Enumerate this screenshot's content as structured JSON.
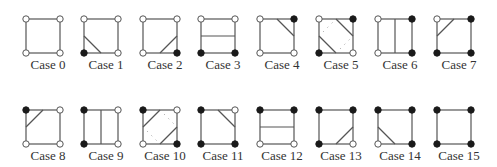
{
  "diagram": {
    "title": "",
    "colors": {
      "edge": "#555555",
      "contour": "#555555",
      "filled_vertex": "#1a1a1a",
      "empty_vertex_fill": "#ffffff",
      "empty_vertex_stroke": "#555555",
      "ambiguous_dots": "#999999",
      "label": "#333333"
    },
    "layout": {
      "square_size": 34,
      "column_x": [
        26,
        84,
        143,
        201,
        260,
        319,
        378,
        437
      ],
      "row_y": [
        19,
        110
      ],
      "label_offset_y": 38
    },
    "vertex_order": [
      "top-left",
      "top-right",
      "bottom-right",
      "bottom-left"
    ],
    "cases": [
      {
        "label": "Case 0",
        "row": 0,
        "col": 0,
        "vertices": [
          0,
          0,
          0,
          0
        ],
        "contours": [],
        "dotted": []
      },
      {
        "label": "Case 1",
        "row": 0,
        "col": 1,
        "vertices": [
          0,
          0,
          0,
          1
        ],
        "contours": [
          [
            "L",
            "B"
          ]
        ],
        "dotted": []
      },
      {
        "label": "Case 2",
        "row": 0,
        "col": 2,
        "vertices": [
          0,
          0,
          1,
          0
        ],
        "contours": [
          [
            "B",
            "R"
          ]
        ],
        "dotted": []
      },
      {
        "label": "Case 3",
        "row": 0,
        "col": 3,
        "vertices": [
          0,
          0,
          1,
          1
        ],
        "contours": [
          [
            "L",
            "R"
          ]
        ],
        "dotted": []
      },
      {
        "label": "Case 4",
        "row": 0,
        "col": 4,
        "vertices": [
          0,
          1,
          0,
          0
        ],
        "contours": [
          [
            "T",
            "R"
          ]
        ],
        "dotted": []
      },
      {
        "label": "Case 5",
        "row": 0,
        "col": 5,
        "vertices": [
          0,
          1,
          0,
          1
        ],
        "contours": [
          [
            "T",
            "R"
          ],
          [
            "L",
            "B"
          ]
        ],
        "dotted": [
          [
            "L",
            "T"
          ],
          [
            "B",
            "R"
          ]
        ]
      },
      {
        "label": "Case 6",
        "row": 0,
        "col": 6,
        "vertices": [
          0,
          1,
          1,
          0
        ],
        "contours": [
          [
            "T",
            "B"
          ]
        ],
        "dotted": []
      },
      {
        "label": "Case 7",
        "row": 0,
        "col": 7,
        "vertices": [
          0,
          1,
          1,
          1
        ],
        "contours": [
          [
            "T",
            "L"
          ]
        ],
        "dotted": []
      },
      {
        "label": "Case 8",
        "row": 1,
        "col": 0,
        "vertices": [
          1,
          0,
          0,
          0
        ],
        "contours": [
          [
            "T",
            "L"
          ]
        ],
        "dotted": []
      },
      {
        "label": "Case 9",
        "row": 1,
        "col": 1,
        "vertices": [
          1,
          0,
          0,
          1
        ],
        "contours": [
          [
            "T",
            "B"
          ]
        ],
        "dotted": []
      },
      {
        "label": "Case 10",
        "row": 1,
        "col": 2,
        "vertices": [
          1,
          0,
          1,
          0
        ],
        "contours": [
          [
            "T",
            "L"
          ],
          [
            "B",
            "R"
          ]
        ],
        "dotted": [
          [
            "T",
            "R"
          ],
          [
            "L",
            "B"
          ]
        ]
      },
      {
        "label": "Case 11",
        "row": 1,
        "col": 3,
        "vertices": [
          1,
          0,
          1,
          1
        ],
        "contours": [
          [
            "T",
            "R"
          ]
        ],
        "dotted": []
      },
      {
        "label": "Case 12",
        "row": 1,
        "col": 4,
        "vertices": [
          1,
          1,
          0,
          0
        ],
        "contours": [
          [
            "L",
            "R"
          ]
        ],
        "dotted": []
      },
      {
        "label": "Case 13",
        "row": 1,
        "col": 5,
        "vertices": [
          1,
          1,
          0,
          1
        ],
        "contours": [
          [
            "B",
            "R"
          ]
        ],
        "dotted": []
      },
      {
        "label": "Case 14",
        "row": 1,
        "col": 6,
        "vertices": [
          1,
          1,
          1,
          0
        ],
        "contours": [
          [
            "L",
            "B"
          ]
        ],
        "dotted": []
      },
      {
        "label": "Case 15",
        "row": 1,
        "col": 7,
        "vertices": [
          1,
          1,
          1,
          1
        ],
        "contours": [],
        "dotted": []
      }
    ]
  }
}
